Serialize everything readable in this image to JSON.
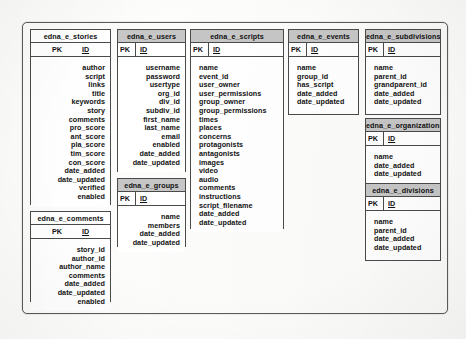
{
  "diagram": {
    "pk_label": "PK",
    "id_label": "ID",
    "entities": [
      {
        "key": "stories",
        "name": "edna_e_stories",
        "header_style": "white",
        "key_style": "center",
        "field_align": "right",
        "fields": [
          "author",
          "script",
          "links",
          "title",
          "keywords",
          "story",
          "comments",
          "pro_score",
          "ant_score",
          "pla_score",
          "tim_score",
          "con_score",
          "date_added",
          "date_updated",
          "verified",
          "enabled"
        ]
      },
      {
        "key": "comments",
        "name": "edna_e_comments",
        "header_style": "white",
        "key_style": "center",
        "field_align": "right",
        "fields": [
          "story_id",
          "author_id",
          "author_name",
          "comments",
          "date_added",
          "date_updated",
          "enabled"
        ]
      },
      {
        "key": "users",
        "name": "edna_e_users",
        "header_style": "gray",
        "key_style": "left",
        "field_align": "right",
        "fields": [
          "username",
          "password",
          "usertype",
          "org_id",
          "div_id",
          "subdiv_id",
          "first_name",
          "last_name",
          "email",
          "enabled",
          "date_added",
          "date_updated"
        ]
      },
      {
        "key": "groups",
        "name": "edna_e_groups",
        "header_style": "gray",
        "key_style": "left",
        "field_align": "right",
        "fields": [
          "name",
          "members",
          "date_added",
          "date_updated"
        ]
      },
      {
        "key": "scripts",
        "name": "edna_e_scripts",
        "header_style": "gray",
        "key_style": "left",
        "field_align": "left",
        "fields": [
          "name",
          "event_id",
          "user_owner",
          "user_permissions",
          "group_owner",
          "group_permissions",
          "times",
          "places",
          "concerns",
          "protagonists",
          "antagonists",
          "images",
          "video",
          "audio",
          "comments",
          "instructions",
          "script_filename",
          "date_added",
          "date_updated"
        ]
      },
      {
        "key": "events",
        "name": "edna_e_events",
        "header_style": "gray",
        "key_style": "left",
        "field_align": "left",
        "fields": [
          "name",
          "group_id",
          "has_script",
          "date_added",
          "date_updated"
        ]
      },
      {
        "key": "subdivisions",
        "name": "edna_e_subdivisions",
        "header_style": "gray",
        "key_style": "left",
        "field_align": "left",
        "fields": [
          "name",
          "parent_id",
          "grandparent_id",
          "date_added",
          "date_updated"
        ]
      },
      {
        "key": "organizations",
        "name": "edna_e_organizations",
        "header_style": "gray",
        "key_style": "left",
        "field_align": "left",
        "fields": [
          "name",
          "date_added",
          "date_updated"
        ]
      },
      {
        "key": "divisions",
        "name": "edna_e_divisions",
        "header_style": "gray",
        "key_style": "left",
        "field_align": "left",
        "fields": [
          "name",
          "parent_id",
          "date_added",
          "date_updated"
        ]
      }
    ],
    "colors": {
      "header_gray": "#c6c6c6",
      "header_white": "#ffffff",
      "border": "#4a4a4a",
      "paper": "#fdfdfc",
      "text": "#111111"
    }
  }
}
